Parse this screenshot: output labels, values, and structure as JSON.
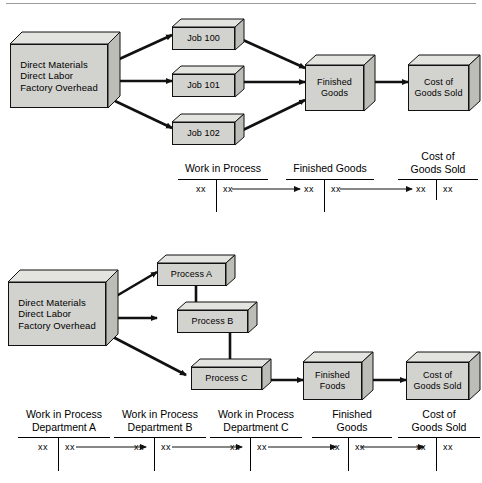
{
  "document": {
    "title": "Job Order Costing vs Process Costing Cost Flow Diagrams",
    "top_rule": true
  },
  "diagram_job_order": {
    "name": "job-order-costing-flow",
    "boxes": {
      "inputs": {
        "lines": "Direct Materials\nDirect Labor\nFactory Overhead"
      },
      "job_100": {
        "label": "Job 100"
      },
      "job_101": {
        "label": "Job 101"
      },
      "job_102": {
        "label": "Job 102"
      },
      "finished_goods": {
        "lines": "Finished\nGoods"
      },
      "cost_of_goods_sold": {
        "lines": "Cost of\nGoods Sold"
      }
    },
    "flows": [
      {
        "from": "inputs",
        "to": "job_100"
      },
      {
        "from": "inputs",
        "to": "job_101"
      },
      {
        "from": "inputs",
        "to": "job_102"
      },
      {
        "from": "job_100",
        "to": "finished_goods"
      },
      {
        "from": "job_101",
        "to": "finished_goods"
      },
      {
        "from": "job_102",
        "to": "finished_goods"
      },
      {
        "from": "finished_goods",
        "to": "cost_of_goods_sold"
      }
    ],
    "t_accounts": [
      {
        "title": "Work in Process",
        "debit": "xx",
        "credit": "xx",
        "transfer_arrow": true
      },
      {
        "title": "Finished Goods",
        "debit": "xx",
        "credit": "xx",
        "transfer_arrow": true
      },
      {
        "title": "Cost of\nGoods Sold",
        "debit": "xx",
        "credit": "xx",
        "transfer_arrow": false
      }
    ]
  },
  "diagram_process_costing": {
    "name": "process-costing-flow",
    "boxes": {
      "inputs": {
        "lines": "Direct Materials\nDirect Labor\nFactory Overhead"
      },
      "process_a": {
        "label": "Process A"
      },
      "process_b": {
        "label": "Process B"
      },
      "process_c": {
        "label": "Process C"
      },
      "finished_goods": {
        "lines": "Finished\nFoods"
      },
      "cost_of_goods_sold": {
        "lines": "Cost of\nGoods Sold"
      }
    },
    "flows": [
      {
        "from": "inputs",
        "to": "process_a"
      },
      {
        "from": "inputs",
        "to": "process_b"
      },
      {
        "from": "inputs",
        "to": "process_c"
      },
      {
        "from": "process_a",
        "to": "process_b"
      },
      {
        "from": "process_b",
        "to": "process_c"
      },
      {
        "from": "process_c",
        "to": "finished_goods"
      },
      {
        "from": "finished_goods",
        "to": "cost_of_goods_sold"
      }
    ],
    "t_accounts": [
      {
        "title": "Work in Process\nDepartment A",
        "debit": "xx",
        "credit": "xx",
        "transfer_arrow": true
      },
      {
        "title": "Work in Process\nDepartment B",
        "debit": "xx",
        "credit": "xx",
        "transfer_arrow": true
      },
      {
        "title": "Work in Process\nDepartment C",
        "debit": "xx",
        "credit": "xx",
        "transfer_arrow": true
      },
      {
        "title": "Finished\nGoods",
        "debit": "xx",
        "credit": "xx",
        "transfer_arrow": true
      },
      {
        "title": "Cost of\nGoods Sold",
        "debit": "xx",
        "credit": "xx",
        "transfer_arrow": false
      }
    ]
  },
  "style": {
    "box_front_fill": "#d2d2ce",
    "box_top_fill": "#e3e3df",
    "box_side_fill": "#bdbdb8",
    "stroke": "#111111",
    "rule_color": "#9a9a9a",
    "background": "#ffffff"
  }
}
